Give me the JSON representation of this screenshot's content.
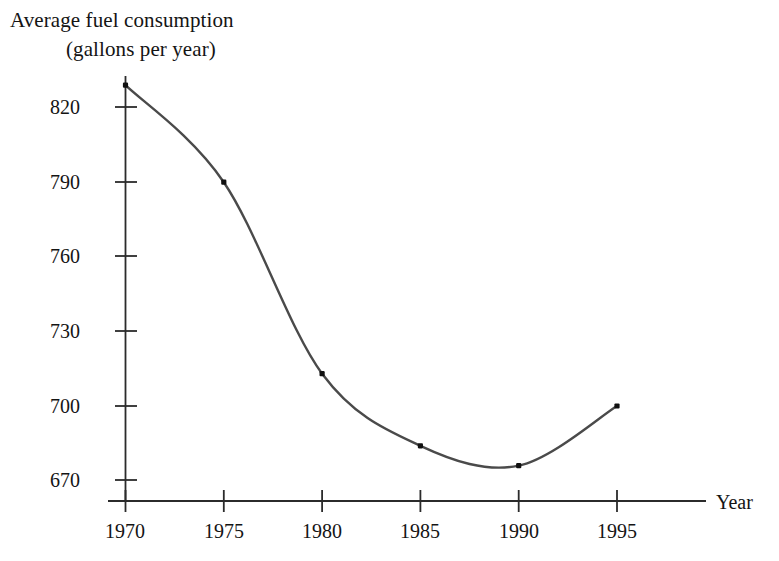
{
  "chart_data": {
    "type": "line",
    "title": "Average fuel consumption (gallons per year)",
    "title_lines": [
      "Average fuel consumption",
      "(gallons per year)"
    ],
    "xlabel": "Year",
    "ylabel": "Average fuel consumption (gallons per year)",
    "x": [
      1970,
      1975,
      1980,
      1985,
      1990,
      1995
    ],
    "values": [
      829,
      790,
      713,
      684,
      676,
      700
    ],
    "series": [
      {
        "name": "Average fuel consumption",
        "values": [
          829,
          790,
          713,
          684,
          676,
          700
        ]
      }
    ],
    "x_tick_labels": [
      "1970",
      "1975",
      "1980",
      "1985",
      "1990",
      "1995"
    ],
    "y_tick_labels": [
      "820",
      "790",
      "760",
      "730",
      "700",
      "670"
    ],
    "y_ticks": [
      820,
      790,
      760,
      730,
      700,
      670
    ],
    "xlim": [
      1970,
      1995
    ],
    "ylim": [
      661,
      838
    ],
    "grid": false,
    "legend": false,
    "markers": "filled-square-dot",
    "line_color": "#4a4a4a",
    "marker_color": "#101010",
    "axis_color": "#2b2b2b",
    "background": "#ffffff"
  },
  "axes": {
    "x_axis_name": "Year",
    "y_axis_name": ""
  }
}
